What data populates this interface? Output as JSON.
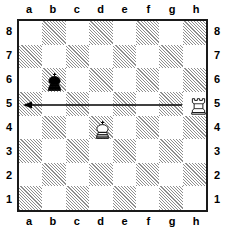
{
  "diagram": {
    "type": "chess-board-diagram",
    "orientation": "white-bottom",
    "board_size": 8
  },
  "coordinates": {
    "files": [
      "a",
      "b",
      "c",
      "d",
      "e",
      "f",
      "g",
      "h"
    ],
    "ranks": [
      "8",
      "7",
      "6",
      "5",
      "4",
      "3",
      "2",
      "1"
    ]
  },
  "colors": {
    "light_square": "#ffffff",
    "dark_square_hatch": "#8e8e8e",
    "border": "#1a1a1a",
    "piece_outline": "#000000",
    "piece_fill_white": "#ffffff",
    "piece_fill_black": "#000000",
    "arrow": "#000000"
  },
  "pieces": [
    {
      "id": "black-king-b6",
      "name": "black-king",
      "color": "black",
      "type": "king",
      "square": "b6",
      "file_index": 1,
      "rank_index": 2
    },
    {
      "id": "white-king-d4",
      "name": "white-king",
      "color": "white",
      "type": "king",
      "square": "d4",
      "file_index": 3,
      "rank_index": 4
    },
    {
      "id": "white-rook-h5",
      "name": "white-rook",
      "color": "white",
      "type": "rook",
      "square": "h5",
      "file_index": 7,
      "rank_index": 3
    }
  ],
  "arrows": [
    {
      "id": "move-arrow-h5-a5",
      "name": "move-arrow",
      "from_square": "h5",
      "to_square": "a5",
      "direction": "left",
      "x1": 182,
      "y1": 105,
      "x2": 23,
      "y2": 105
    }
  ]
}
